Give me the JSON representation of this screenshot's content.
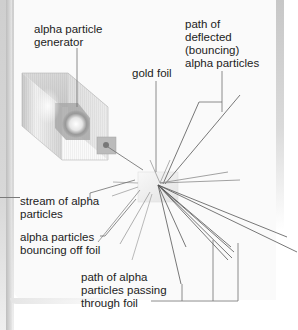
{
  "diagram": {
    "labels": {
      "generator": "alpha particle\ngenerator",
      "gold_foil": "gold foil",
      "deflected": "path of\ndeflected\n(bouncing)\nalpha particles",
      "stream": "stream of alpha\nparticles",
      "bouncing": "alpha particles\nbouncing off foil",
      "passing": "path of alpha\nparticles passing\nthrough foil"
    },
    "colors": {
      "line": "#555555",
      "leader": "#6e6e6e",
      "text": "#222222",
      "box_light": "#e8e8e8",
      "box_dark": "#bdbdbd",
      "foil": "#eeeeee"
    }
  }
}
